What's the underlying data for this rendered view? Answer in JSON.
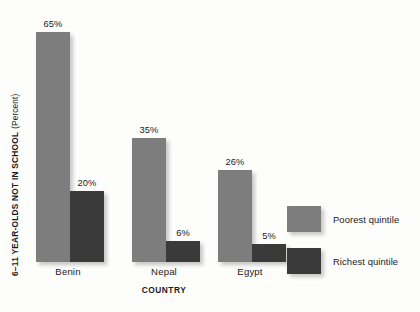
{
  "chart_data": {
    "type": "bar",
    "title": "",
    "subtitle": "",
    "xlabel": "COUNTRY",
    "ylabel": "6–11 YEAR-OLDS NOT IN SCHOOL",
    "ylabel_unit": "(Percent)",
    "categories": [
      "Benin",
      "Nepal",
      "Egypt"
    ],
    "series": [
      {
        "name": "Poorest quintile",
        "color": "#7d7d7d",
        "values": [
          65,
          35,
          26
        ],
        "labels": [
          "65%",
          "35%",
          "26%"
        ]
      },
      {
        "name": "Richest quintile",
        "color": "#3a3a3a",
        "values": [
          20,
          6,
          5
        ],
        "labels": [
          "20%",
          "6%",
          "5%"
        ]
      }
    ],
    "ylim": [
      0,
      70
    ],
    "grid": false,
    "legend_position": "right",
    "value_label_suffix": "%"
  },
  "legend": {
    "items": [
      {
        "label": "Poorest quintile",
        "color": "#7d7d7d"
      },
      {
        "label": "Richest quintile",
        "color": "#3a3a3a"
      }
    ]
  },
  "axes": {
    "y_title_main": "6–11 YEAR-OLDS NOT IN SCHOOL",
    "y_title_unit": "(Percent)",
    "x_title": "COUNTRY"
  }
}
